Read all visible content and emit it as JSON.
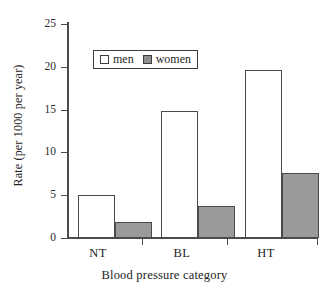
{
  "chart_data": {
    "type": "bar",
    "title": "",
    "subtitle": "",
    "xlabel": "Blood pressure category",
    "ylabel": "Rate (per 1000 per year)",
    "categories": [
      "NT",
      "BL",
      "HT"
    ],
    "series": [
      {
        "name": "men",
        "values": [
          5.0,
          14.8,
          19.6
        ],
        "color": "#ffffff"
      },
      {
        "name": "women",
        "values": [
          1.9,
          3.7,
          7.6
        ],
        "color": "#9a9a9a"
      }
    ],
    "ylim": [
      0,
      25
    ],
    "yticks": [
      0,
      5,
      10,
      15,
      20,
      25
    ],
    "ytick_labels": [
      "0",
      "5",
      "10",
      "15",
      "20",
      "25"
    ],
    "grid": false,
    "legend_position": "upper left",
    "legend_entries": [
      "men",
      "women"
    ],
    "annotations": []
  },
  "axes": {
    "y_title": "Rate (per 1000 per year)",
    "x_title": "Blood pressure category",
    "y_tick_labels": [
      "25",
      "20",
      "15",
      "10",
      "5",
      "0"
    ],
    "x_tick_labels": [
      "NT",
      "BL",
      "HT"
    ]
  },
  "legend": {
    "men_label": "men",
    "women_label": "women"
  },
  "colors": {
    "men_fill": "#ffffff",
    "women_fill": "#9a9a9a",
    "bar_outline": "#4a4a4a",
    "axis": "#4d4d4d",
    "text": "#222222",
    "background": "#ffffff"
  }
}
